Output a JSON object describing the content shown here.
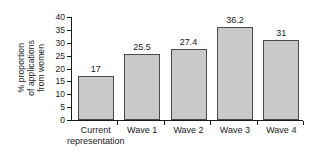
{
  "chart_data": {
    "type": "bar",
    "title": "",
    "xlabel": "",
    "ylabel_lines": [
      "% proportion",
      "of applications",
      "from women"
    ],
    "ylabel": "% proportion of applications from women",
    "categories": [
      "Current representation",
      "Wave 1",
      "Wave 2",
      "Wave 3",
      "Wave 4"
    ],
    "category_lines": [
      [
        "Current",
        "representation"
      ],
      [
        "Wave 1"
      ],
      [
        "Wave 2"
      ],
      [
        "Wave 3"
      ],
      [
        "Wave 4"
      ]
    ],
    "values": [
      17,
      25.5,
      27.4,
      36.2,
      31
    ],
    "value_labels": [
      "17",
      "25.5",
      "27.4",
      "36.2",
      "31"
    ],
    "ylim": [
      0,
      40
    ],
    "ytick_values": [
      0,
      5,
      10,
      15,
      20,
      25,
      30,
      35,
      40
    ],
    "ytick_labels": [
      "0",
      "5",
      "10",
      "15",
      "20",
      "25",
      "30",
      "35",
      "40"
    ],
    "grid": false,
    "legend": null,
    "legend_position": "none",
    "bar_fill_color": "#c9c9c9",
    "bar_edge_color": "#4a4a4a",
    "axis_color": "#1a1a1a",
    "background_color": "#ffffff"
  }
}
